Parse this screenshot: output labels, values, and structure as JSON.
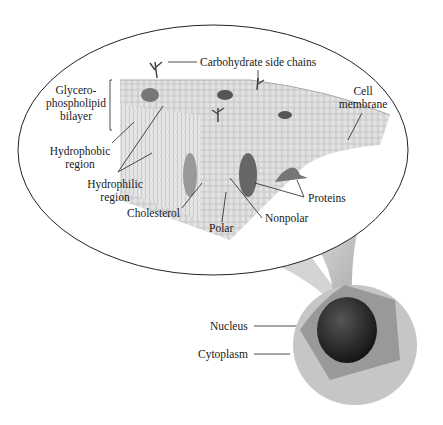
{
  "diagram": {
    "labels": {
      "carbohydrate": "Carbohydrate side chains",
      "bilayer": [
        "Glycero-",
        "phospholipid",
        "bilayer"
      ],
      "cell_membrane": [
        "Cell",
        "membrane"
      ],
      "hydrophobic": [
        "Hydrophobic",
        "region"
      ],
      "hydrophilic": [
        "Hydrophilic",
        "region"
      ],
      "cholesterol": "Cholesterol",
      "polar": "Polar",
      "nonpolar": "Nonpolar",
      "proteins": "Proteins",
      "nucleus": "Nucleus",
      "cytoplasm": "Cytoplasm"
    },
    "colors": {
      "outline": "#222222",
      "membrane": "#c9c9c9",
      "head": "#b5b5b5",
      "protein": "#7a7a7a",
      "nucleus": "#2a2a2a",
      "cell": "#bdbdbd"
    }
  }
}
